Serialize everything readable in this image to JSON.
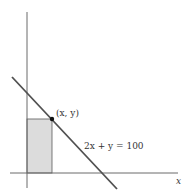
{
  "diagram": {
    "type": "coordinate-plot",
    "axes": {
      "x_label": "x",
      "y_label": ""
    },
    "line": {
      "equation_label": "2x + y = 100",
      "color": "#505050"
    },
    "point": {
      "label": "(x, y)",
      "color": "#111111"
    },
    "shaded_rectangle": {
      "fill": "#dcdcdc",
      "stroke": "#5a5a5a"
    },
    "axis_color": "#6a6a6a"
  }
}
